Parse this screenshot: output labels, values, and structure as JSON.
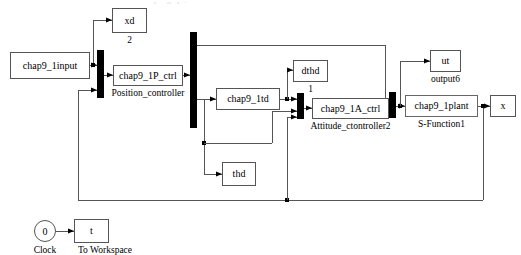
{
  "diagram": {
    "title_fragment": "chap9_1sim",
    "blocks": [
      {
        "id": "input",
        "label": "chap9_1input",
        "caption": "",
        "x": 10,
        "y": 52,
        "w": 80,
        "h": 27
      },
      {
        "id": "xd",
        "label": "xd",
        "caption": "2",
        "x": 112,
        "y": 8,
        "w": 35,
        "h": 25
      },
      {
        "id": "pctrl",
        "label": "chap9_1P_ctrl",
        "caption": "Position_controller",
        "x": 113,
        "y": 65,
        "w": 70,
        "h": 21
      },
      {
        "id": "td",
        "label": "chap9_1td",
        "caption": "",
        "x": 216,
        "y": 88,
        "w": 64,
        "h": 22
      },
      {
        "id": "dthd",
        "label": "dthd",
        "caption": "1",
        "x": 293,
        "y": 60,
        "w": 35,
        "h": 22
      },
      {
        "id": "actrl",
        "label": "chap9_1A_ctrl",
        "caption": "Attitude_ctontroller2",
        "x": 312,
        "y": 98,
        "w": 77,
        "h": 21
      },
      {
        "id": "ut",
        "label": "ut",
        "caption": "output6",
        "x": 430,
        "y": 50,
        "w": 31,
        "h": 22
      },
      {
        "id": "plant",
        "label": "chap9_1plant",
        "caption": "S-Function1",
        "x": 405,
        "y": 95,
        "w": 73,
        "h": 22
      },
      {
        "id": "x",
        "label": "x",
        "caption": "",
        "x": 490,
        "y": 95,
        "w": 26,
        "h": 22
      },
      {
        "id": "thd",
        "label": "thd",
        "caption": "",
        "x": 222,
        "y": 162,
        "w": 34,
        "h": 24
      },
      {
        "id": "tows",
        "label": "t",
        "caption": "To Workspace",
        "x": 74,
        "y": 219,
        "w": 35,
        "h": 24
      }
    ],
    "bars": [
      {
        "id": "mux1",
        "x": 97,
        "y": 50,
        "w": 7,
        "h": 48
      },
      {
        "id": "demux1",
        "x": 190,
        "y": 32,
        "w": 7,
        "h": 96
      },
      {
        "id": "mux2",
        "x": 297,
        "y": 93,
        "w": 7,
        "h": 26
      },
      {
        "id": "mux3",
        "x": 389,
        "y": 92,
        "w": 7,
        "h": 26
      }
    ],
    "clock": {
      "label": "0",
      "caption": "Clock",
      "cx": 45,
      "cy": 231,
      "r": 11
    }
  }
}
